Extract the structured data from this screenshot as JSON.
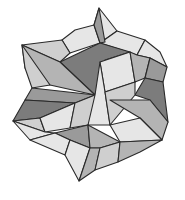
{
  "figure": {
    "title": "",
    "background": "#ffffff",
    "stroke": "#2a2a2a",
    "shades": {
      "light": "#e6e6e6",
      "lightmid": "#cfcfcf",
      "mid": "#b4b4b4",
      "middark": "#9a9a9a",
      "dark": "#7c7c7c"
    },
    "facets": [
      {
        "points": "99,8 117,31 100,43 94,25",
        "shade": "light"
      },
      {
        "points": "62,40 75,30 94,25 100,43 70,53",
        "shade": "light"
      },
      {
        "points": "22,45 62,40 70,53 60,62",
        "shade": "lightmid"
      },
      {
        "points": "117,31 145,40 137,55 100,43",
        "shade": "light"
      },
      {
        "points": "145,40 160,52 167,67 150,58 137,55",
        "shade": "light"
      },
      {
        "points": "94,25 100,43 105,42 99,8",
        "shade": "middark"
      },
      {
        "points": "60,62 100,43 130,52 105,60 95,95",
        "shade": "dark"
      },
      {
        "points": "22,45 60,62 95,95 50,85 25,68",
        "shade": "mid"
      },
      {
        "points": "22,45 25,68 32,88 50,85",
        "shade": "lightmid"
      },
      {
        "points": "100,62 130,52 135,82 105,92",
        "shade": "light"
      },
      {
        "points": "130,52 137,55 150,58 145,78 135,82",
        "shade": "mid"
      },
      {
        "points": "150,58 167,67 163,82 145,78",
        "shade": "middark"
      },
      {
        "points": "145,78 163,82 168,122 150,100 135,95",
        "shade": "dark"
      },
      {
        "points": "32,88 95,95 75,103 25,100",
        "shade": "middark"
      },
      {
        "points": "25,100 75,103 40,118 13,121",
        "shade": "dark"
      },
      {
        "points": "13,121 40,118 45,132",
        "shade": "lightmid"
      },
      {
        "points": "40,118 75,103 70,128 45,132",
        "shade": "light"
      },
      {
        "points": "75,103 95,95 105,110 88,125 70,128",
        "shade": "lightmid"
      },
      {
        "points": "95,95 100,62 105,92 110,125 88,125",
        "shade": "light"
      },
      {
        "points": "105,92 135,82 135,95 110,125",
        "shade": "lightmid"
      },
      {
        "points": "110,100 150,100 168,122 162,140 140,118",
        "shade": "mid"
      },
      {
        "points": "110,125 140,118 162,140 120,142",
        "shade": "light"
      },
      {
        "points": "55,133 88,125 90,148 70,140",
        "shade": "middark"
      },
      {
        "points": "88,125 120,142 100,148 90,148",
        "shade": "mid"
      },
      {
        "points": "13,121 45,132 55,133 30,140",
        "shade": "light"
      },
      {
        "points": "30,140 55,133 70,140 65,155",
        "shade": "light"
      },
      {
        "points": "65,155 70,140 90,148 79,181",
        "shade": "light"
      },
      {
        "points": "90,148 100,148 95,170 79,181",
        "shade": "mid"
      },
      {
        "points": "100,148 120,142 118,162 95,170",
        "shade": "lightmid"
      },
      {
        "points": "120,142 162,140 140,152 118,162",
        "shade": "mid"
      }
    ]
  }
}
